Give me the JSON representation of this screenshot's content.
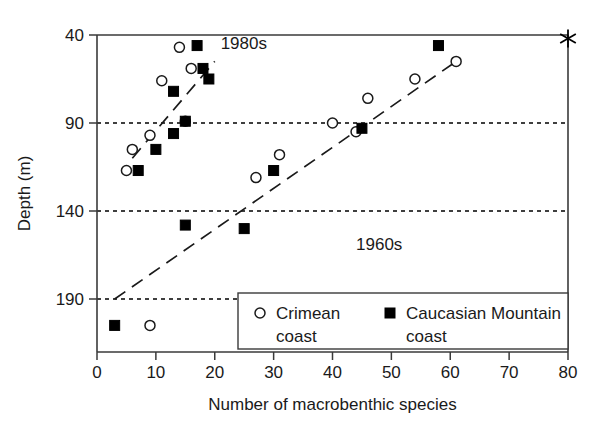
{
  "chart_data": {
    "type": "scatter",
    "title": "",
    "xlabel": "Number of macrobenthic species",
    "ylabel": "Depth (m)",
    "xlim": [
      0,
      80
    ],
    "ylim": [
      40,
      215
    ],
    "y_inverted": true,
    "xticks": [
      0,
      10,
      20,
      30,
      40,
      50,
      60,
      70,
      80
    ],
    "yticks": [
      40,
      90,
      140,
      190
    ],
    "gridlines": {
      "horizontal_dashed_at": [
        90,
        140,
        190
      ],
      "vertical": false
    },
    "legend": {
      "position": "bottom-right-inside",
      "entries": [
        {
          "marker": "open-circle",
          "label_line1": "Crimean",
          "label_line2": "coast"
        },
        {
          "marker": "filled-square",
          "label_line1": "Caucasian Mountain",
          "label_line2": "coast"
        }
      ]
    },
    "annotations": [
      {
        "text": "1980s",
        "x": 21,
        "y": 48
      },
      {
        "text": "1960s",
        "x": 44,
        "y": 162
      }
    ],
    "series": [
      {
        "name": "Crimean coast",
        "marker": "open-circle",
        "points": [
          {
            "x": 14,
            "y": 47
          },
          {
            "x": 16,
            "y": 59
          },
          {
            "x": 11,
            "y": 66
          },
          {
            "x": 15,
            "y": 89
          },
          {
            "x": 9,
            "y": 97
          },
          {
            "x": 6,
            "y": 105
          },
          {
            "x": 5,
            "y": 117
          },
          {
            "x": 27,
            "y": 121
          },
          {
            "x": 31,
            "y": 108
          },
          {
            "x": 40,
            "y": 90
          },
          {
            "x": 44,
            "y": 95
          },
          {
            "x": 46,
            "y": 76
          },
          {
            "x": 54,
            "y": 65
          },
          {
            "x": 61,
            "y": 55
          },
          {
            "x": 9,
            "y": 205
          }
        ]
      },
      {
        "name": "Caucasian Mountain coast",
        "marker": "filled-square",
        "points": [
          {
            "x": 17,
            "y": 46
          },
          {
            "x": 18,
            "y": 59
          },
          {
            "x": 13,
            "y": 72
          },
          {
            "x": 19,
            "y": 65
          },
          {
            "x": 15,
            "y": 89
          },
          {
            "x": 13,
            "y": 96
          },
          {
            "x": 10,
            "y": 105
          },
          {
            "x": 7,
            "y": 117
          },
          {
            "x": 15,
            "y": 148
          },
          {
            "x": 25,
            "y": 150
          },
          {
            "x": 30,
            "y": 117
          },
          {
            "x": 45,
            "y": 93
          },
          {
            "x": 58,
            "y": 46
          },
          {
            "x": 3,
            "y": 205
          }
        ]
      }
    ],
    "trend_lines": [
      {
        "name": "1980s",
        "x1": 6,
        "y1": 110,
        "x2": 20,
        "y2": 55
      },
      {
        "name": "1960s",
        "x1": 3,
        "y1": 190,
        "x2": 61,
        "y2": 55
      }
    ],
    "special_markers": [
      {
        "symbol": "asterisk",
        "x": 80,
        "y": 42
      }
    ]
  }
}
